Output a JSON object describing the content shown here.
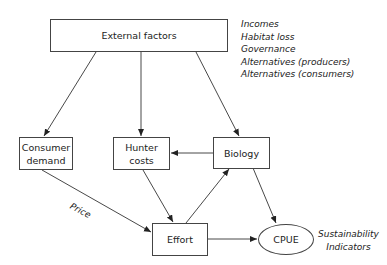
{
  "diagram": {
    "nodes": {
      "external_factors": "External factors",
      "consumer_demand": [
        "Consumer",
        "demand"
      ],
      "hunter_costs": [
        "Hunter",
        "costs"
      ],
      "biology": "Biology",
      "effort": "Effort",
      "cpue": "CPUE"
    },
    "external_factor_list": [
      "Incomes",
      "Habitat loss",
      "Governance",
      "Alternatives (producers)",
      "Alternatives (consumers)"
    ],
    "edge_labels": {
      "price": "Price"
    },
    "sustainability_label": [
      "Sustainability",
      "Indicators"
    ],
    "edges": [
      {
        "from": "External factors",
        "to": "Consumer demand"
      },
      {
        "from": "External factors",
        "to": "Hunter costs"
      },
      {
        "from": "External factors",
        "to": "Biology"
      },
      {
        "from": "Biology",
        "to": "Hunter costs"
      },
      {
        "from": "Consumer demand",
        "to": "Effort",
        "label": "Price"
      },
      {
        "from": "Hunter costs",
        "to": "Effort"
      },
      {
        "from": "Effort",
        "to": "Biology"
      },
      {
        "from": "Biology",
        "to": "CPUE"
      },
      {
        "from": "Effort",
        "to": "CPUE"
      }
    ]
  }
}
